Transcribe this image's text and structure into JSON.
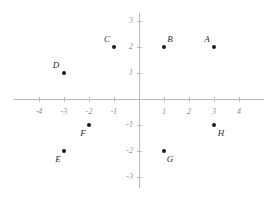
{
  "chart_data": {
    "type": "scatter",
    "title": "",
    "xlabel": "",
    "ylabel": "",
    "xlim": [
      -4.8,
      4.8
    ],
    "ylim": [
      -3.3,
      3.3
    ],
    "grid": false,
    "legend": null,
    "x_ticks": [
      "-4",
      "-3",
      "-2",
      "-1",
      "1",
      "2",
      "3",
      "4"
    ],
    "x_tick_values": [
      -4,
      -3,
      -2,
      -1,
      1,
      2,
      3,
      4
    ],
    "y_ticks": [
      "3",
      "2",
      "1",
      "-1",
      "-2",
      "-3"
    ],
    "y_tick_values": [
      3,
      2,
      1,
      -1,
      -2,
      -3
    ],
    "points": [
      {
        "label": "A",
        "x": 3,
        "y": 2,
        "label_dx": -7,
        "label_dy": -8
      },
      {
        "label": "B",
        "x": 1,
        "y": 2,
        "label_dx": 6,
        "label_dy": -8
      },
      {
        "label": "C",
        "x": -1,
        "y": 2,
        "label_dx": -7,
        "label_dy": -8
      },
      {
        "label": "D",
        "x": -3,
        "y": 1,
        "label_dx": -8,
        "label_dy": -8
      },
      {
        "label": "E",
        "x": -3,
        "y": -2,
        "label_dx": -6,
        "label_dy": 8
      },
      {
        "label": "F",
        "x": -2,
        "y": -1,
        "label_dx": -6,
        "label_dy": 8
      },
      {
        "label": "G",
        "x": 1,
        "y": -2,
        "label_dx": 6,
        "label_dy": 8
      },
      {
        "label": "H",
        "x": 3,
        "y": -1,
        "label_dx": 7,
        "label_dy": 8
      }
    ],
    "colors": {
      "point": "#1c1c1c",
      "axis": "#b9b9b9",
      "tick_label": "#8e8e8e",
      "point_label": "#2a2a2a",
      "background": "#ffffff"
    },
    "geometry": {
      "origin_x": 139,
      "origin_y": 99,
      "unit_x": 25,
      "unit_y": 26
    }
  }
}
